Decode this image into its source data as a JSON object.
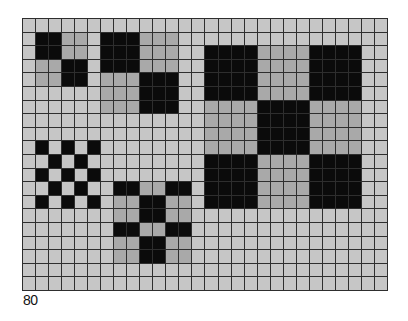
{
  "figure": {
    "label": "80",
    "grid": {
      "columns": 28,
      "rows": 20
    },
    "colors": {
      "light": "#c6c6c6",
      "grey": "#a9a9a9",
      "black": "#0b0b0b",
      "lines": "#2e2e2e"
    },
    "patterns": [
      {
        "name": "small-2x2-block-pattern",
        "origin": {
          "col": 1,
          "row": 1
        },
        "block_size": 2,
        "layout": [
          [
            "b",
            "g"
          ],
          [
            "g",
            "b"
          ]
        ]
      },
      {
        "name": "medium-3x3-block-pattern",
        "origin": {
          "col": 6,
          "row": 1
        },
        "block_size": 3,
        "layout": [
          [
            "b",
            "g"
          ],
          [
            "g",
            "b"
          ]
        ]
      },
      {
        "name": "large-4x4-block-pattern",
        "origin": {
          "col": 14,
          "row": 2
        },
        "block_size": 4,
        "layout": [
          [
            "b",
            "g",
            "b"
          ],
          [
            "g",
            "b",
            "g"
          ],
          [
            "b",
            "g",
            "b"
          ]
        ]
      },
      {
        "name": "checkerboard-pattern",
        "origin": {
          "col": 1,
          "row": 9
        },
        "block_size": 1,
        "layout": [
          [
            "b",
            "l",
            "b",
            "l",
            "b"
          ],
          [
            "l",
            "b",
            "l",
            "b",
            "l"
          ],
          [
            "b",
            "l",
            "b",
            "l",
            "b"
          ],
          [
            "l",
            "b",
            "l",
            "b",
            "l"
          ],
          [
            "b",
            "l",
            "b",
            "l",
            "b"
          ]
        ]
      },
      {
        "name": "cross-pattern",
        "origin": {
          "col": 7,
          "row": 12
        },
        "rows": [
          {
            "height": 1,
            "cells": [
              "b",
              "b",
              "g",
              "g",
              "b",
              "b"
            ]
          },
          {
            "height": 2,
            "cells": [
              "g",
              "g",
              "b",
              "b",
              "g",
              "g"
            ]
          },
          {
            "height": 1,
            "cells": [
              "b",
              "b",
              "g",
              "g",
              "b",
              "b"
            ]
          },
          {
            "height": 2,
            "cells": [
              "g",
              "g",
              "b",
              "b",
              "g",
              "g"
            ]
          }
        ]
      }
    ]
  }
}
